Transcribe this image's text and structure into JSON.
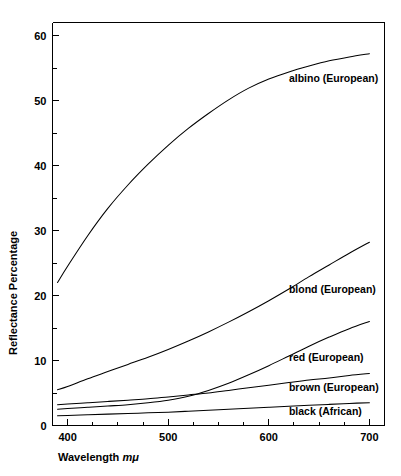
{
  "chart_data": {
    "type": "line",
    "title": "",
    "xlabel": "Wavelength mμ",
    "xlabel_text": "Wavelength ",
    "xlabel_unit": "mμ",
    "ylabel": "Reflectance Percentage",
    "xlim": [
      385,
      715
    ],
    "ylim": [
      0,
      62
    ],
    "grid": false,
    "legend_position": "inline-right-of-curves",
    "x_ticks_major": [
      400,
      500,
      600,
      700
    ],
    "x_ticks_major_labels": [
      "400",
      "500",
      "600",
      "700"
    ],
    "x_ticks_minor": [
      425,
      450,
      475,
      525,
      550,
      575,
      625,
      650,
      675
    ],
    "y_ticks_major": [
      0,
      10,
      20,
      30,
      40,
      50,
      60
    ],
    "y_ticks_major_labels": [
      "0",
      "10",
      "20",
      "30",
      "40",
      "50",
      "60"
    ],
    "y_ticks_minor": [
      5,
      15,
      25,
      35,
      45,
      55
    ],
    "x": [
      390,
      400,
      420,
      440,
      460,
      480,
      500,
      520,
      540,
      560,
      580,
      600,
      620,
      640,
      660,
      680,
      700
    ],
    "series": [
      {
        "name": "albino (European)",
        "label": "albino (European)",
        "color": "#000000",
        "label_x": 620,
        "label_y": 53.5,
        "values": [
          22.0,
          24.5,
          29.2,
          33.4,
          37.0,
          40.2,
          43.1,
          45.7,
          48.0,
          50.1,
          51.9,
          53.3,
          54.4,
          55.3,
          56.1,
          56.7,
          57.2
        ]
      },
      {
        "name": "blond (European)",
        "label": "blond (European)",
        "color": "#000000",
        "label_x": 620,
        "label_y": 21.0,
        "values": [
          5.5,
          6.0,
          7.2,
          8.3,
          9.4,
          10.5,
          11.7,
          13.0,
          14.4,
          15.9,
          17.5,
          19.2,
          21.0,
          22.9,
          24.7,
          26.5,
          28.2
        ]
      },
      {
        "name": "red (European)",
        "label": "red (European)",
        "color": "#000000",
        "label_x": 620,
        "label_y": 10.5,
        "values": [
          2.5,
          2.6,
          2.8,
          3.0,
          3.2,
          3.5,
          3.9,
          4.5,
          5.4,
          6.5,
          7.8,
          9.2,
          10.7,
          12.2,
          13.6,
          14.9,
          16.0
        ]
      },
      {
        "name": "brown (European)",
        "label": "brown (European)",
        "color": "#000000",
        "label_x": 620,
        "label_y": 6.0,
        "values": [
          3.2,
          3.3,
          3.5,
          3.7,
          3.9,
          4.1,
          4.4,
          4.7,
          5.0,
          5.4,
          5.8,
          6.2,
          6.6,
          7.0,
          7.3,
          7.7,
          8.0
        ]
      },
      {
        "name": "black (African)",
        "label": "black (African)",
        "color": "#000000",
        "label_x": 620,
        "label_y": 2.3,
        "values": [
          1.5,
          1.55,
          1.65,
          1.75,
          1.85,
          1.95,
          2.05,
          2.2,
          2.35,
          2.5,
          2.65,
          2.8,
          2.95,
          3.1,
          3.25,
          3.4,
          3.5
        ]
      }
    ]
  }
}
